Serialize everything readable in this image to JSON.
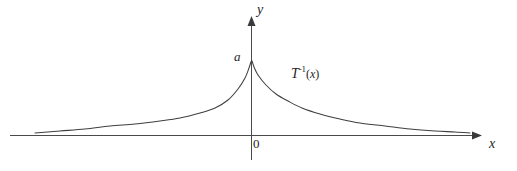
{
  "figure": {
    "background_color": "#ffffff",
    "line_color": "#3f3f3f",
    "axis_color": "#4a4a4a",
    "width": 517,
    "height": 171
  },
  "labels": {
    "y_axis": "y",
    "x_axis": "x",
    "peak_value": "a",
    "origin": "0",
    "curve_name_base": "T",
    "curve_name_exponent": "-1",
    "curve_name_arg_open": "(",
    "curve_name_arg_var": "x",
    "curve_name_arg_close": ")",
    "curve_name_full": "T^-1(x)"
  },
  "chart_data": {
    "type": "line",
    "title": "",
    "xlabel": "x",
    "ylabel": "y",
    "grid": false,
    "legend": "none",
    "annotations": [
      {
        "text": "a",
        "x": 0,
        "y": 1.0,
        "note": "peak value of curve on y-axis"
      },
      {
        "text": "0",
        "x": 0,
        "y": 0,
        "note": "origin label"
      },
      {
        "text": "T^-1(x)",
        "x": 0.9,
        "y": 0.62,
        "note": "curve label at right of peak"
      }
    ],
    "axes": {
      "x_axis_y_pixel": 135,
      "y_axis_x_pixel": 251,
      "x_range_pixels": [
        10,
        478
      ],
      "y_range_pixels": [
        18,
        160
      ],
      "x_arrow": true,
      "y_arrow": true
    },
    "series": [
      {
        "name": "T^-1(x)",
        "description": "Symmetric two-sided exponential-decay cusp peaking at a on the y-axis and decaying toward zero on both sides",
        "function": "a * exp(-k*|x|)",
        "peak_y": "a",
        "x": [
          -4.3,
          -3.8,
          -3.3,
          -2.8,
          -2.4,
          -2.0,
          -1.7,
          -1.4,
          -1.1,
          -0.85,
          -0.6,
          -0.4,
          -0.22,
          -0.1,
          0.0,
          0.1,
          0.22,
          0.4,
          0.6,
          0.85,
          1.1,
          1.4,
          1.7,
          2.0,
          2.4,
          2.8,
          3.3,
          3.8,
          4.3
        ],
        "y": [
          0.03,
          0.04,
          0.05,
          0.07,
          0.09,
          0.12,
          0.16,
          0.21,
          0.28,
          0.36,
          0.48,
          0.6,
          0.74,
          0.88,
          1.0,
          0.88,
          0.74,
          0.6,
          0.48,
          0.36,
          0.28,
          0.21,
          0.16,
          0.12,
          0.09,
          0.07,
          0.05,
          0.04,
          0.03
        ],
        "pixel_points": [
          [
            35,
            133
          ],
          [
            60,
            131
          ],
          [
            85,
            129
          ],
          [
            110,
            126
          ],
          [
            135,
            124
          ],
          [
            160,
            121
          ],
          [
            180,
            118
          ],
          [
            200,
            113
          ],
          [
            215,
            108
          ],
          [
            228,
            100
          ],
          [
            238,
            89
          ],
          [
            245,
            78
          ],
          [
            249,
            68
          ],
          [
            251,
            62
          ],
          [
            252,
            61
          ],
          [
            254,
            67
          ],
          [
            258,
            75
          ],
          [
            266,
            85
          ],
          [
            276,
            94
          ],
          [
            288,
            101
          ],
          [
            302,
            108
          ],
          [
            320,
            114
          ],
          [
            340,
            119
          ],
          [
            360,
            123
          ],
          [
            385,
            126
          ],
          [
            410,
            129
          ],
          [
            435,
            131
          ],
          [
            455,
            132
          ],
          [
            470,
            133
          ]
        ]
      }
    ]
  }
}
